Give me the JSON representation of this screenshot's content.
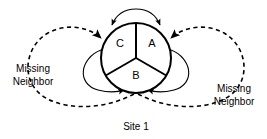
{
  "figure": {
    "caption": "Site 1",
    "background_color": "#ffffff",
    "stroke_color": "#000000"
  },
  "site": {
    "sectors": [
      {
        "id": "A",
        "label": "A",
        "position": "right"
      },
      {
        "id": "B",
        "label": "B",
        "position": "bottom"
      },
      {
        "id": "C",
        "label": "C",
        "position": "left"
      }
    ]
  },
  "annotations": {
    "left": {
      "line1": "Missing",
      "line2": "Neighbor"
    },
    "right": {
      "line1": "Missing",
      "line2": "Neighbor"
    }
  },
  "edges": {
    "solid_self_loops": [
      {
        "name": "top-arc",
        "from": "C",
        "to": "A",
        "style": "solid"
      },
      {
        "name": "lower-left-arc",
        "from": "C",
        "to": "B",
        "style": "solid"
      },
      {
        "name": "lower-right-arc",
        "from": "A",
        "to": "B",
        "style": "solid"
      }
    ],
    "dashed_missing_neighbor_loops": [
      {
        "name": "left-dashed-loop",
        "style": "dashed",
        "target": "C"
      },
      {
        "name": "right-dashed-loop",
        "style": "dashed",
        "target": "A"
      }
    ]
  }
}
